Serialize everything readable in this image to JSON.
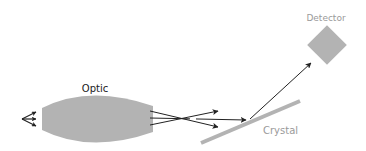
{
  "diagram": {
    "labels": {
      "optic": "Optic",
      "crystal": "Crystal",
      "detector": "Detector"
    },
    "colors": {
      "component_fill": "#b3b3b3",
      "arrow": "#222222",
      "optic_label": "#222222",
      "muted_label": "#9a9a9a"
    },
    "components": [
      {
        "id": "source",
        "kind": "source-rays"
      },
      {
        "id": "optic",
        "kind": "lens-ellipse"
      },
      {
        "id": "crystal",
        "kind": "tilted-bar"
      },
      {
        "id": "detector",
        "kind": "diamond"
      }
    ]
  }
}
